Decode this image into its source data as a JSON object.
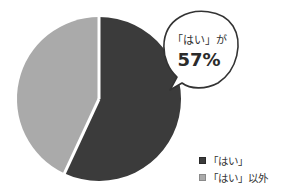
{
  "chart_data": {
    "type": "pie",
    "title": "",
    "categories": [
      "「はい」",
      "「はい」以外"
    ],
    "values": [
      57,
      43
    ],
    "unit": "%",
    "colors": [
      "#3b3b3b",
      "#aaaaaa"
    ],
    "start_angle_deg": 0,
    "direction": "clockwise",
    "annotations": [
      {
        "type": "speech-bubble",
        "line1": "「はい」が",
        "line2": "57%"
      }
    ],
    "legend_position": "bottom-right"
  },
  "callout": {
    "line1": "「はい」が",
    "line2": "57%"
  },
  "legend": {
    "items": [
      {
        "label": "「はい」",
        "color": "#3b3b3b"
      },
      {
        "label": "「はい」以外",
        "color": "#aaaaaa"
      }
    ]
  }
}
